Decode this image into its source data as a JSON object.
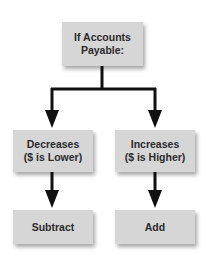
{
  "diagram": {
    "colors": {
      "box_fill": "#d6d6d6",
      "text": "#2b2b2b",
      "arrow": "#111111"
    },
    "root": {
      "lines": [
        "If Accounts",
        "Payable:"
      ]
    },
    "branches": [
      {
        "condition_lines": [
          "Decreases",
          "($ is Lower)"
        ],
        "action": "Subtract"
      },
      {
        "condition_lines": [
          "Increases",
          "($ is Higher)"
        ],
        "action": "Add"
      }
    ]
  }
}
